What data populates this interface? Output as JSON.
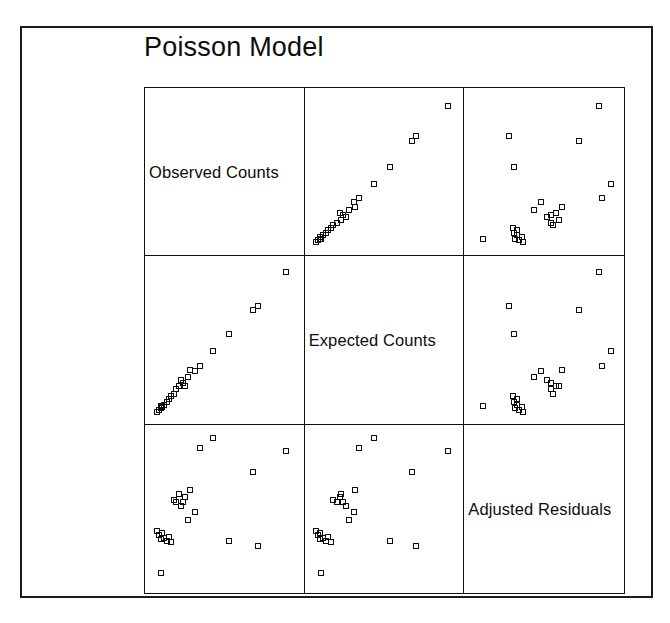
{
  "figure": {
    "title": "Poisson Model",
    "type": "scatterplot-matrix",
    "background_color": "#ffffff",
    "frame_color": "#1a1a1a",
    "marker_color": "#0a0a0a",
    "marker_shape": "open-square"
  },
  "chart_data": {
    "type": "scatter",
    "title": "Poisson Model",
    "xlabel": "",
    "ylabel": "",
    "grid": false,
    "legend": null,
    "layout": "3x3 scatterplot matrix (SPLOM) with variable names on the diagonal",
    "variables": [
      "Observed Counts",
      "Expected Counts",
      "Adjusted Residuals"
    ],
    "diagonal_labels": [
      "Observed Counts",
      "Expected Counts",
      "Adjusted Residuals"
    ],
    "n_points": 24,
    "axis_ranges": {
      "Observed Counts": [
        0,
        1
      ],
      "Expected Counts": [
        0,
        1
      ],
      "Adjusted Residuals": [
        0,
        1
      ]
    },
    "points": [
      {
        "observed": 0.035,
        "expected": 0.03,
        "residual": 0.355
      },
      {
        "observed": 0.05,
        "expected": 0.04,
        "residual": 0.33
      },
      {
        "observed": 0.06,
        "expected": 0.055,
        "residual": 0.3
      },
      {
        "observed": 0.07,
        "expected": 0.06,
        "residual": 0.345
      },
      {
        "observed": 0.085,
        "expected": 0.075,
        "residual": 0.31
      },
      {
        "observed": 0.1,
        "expected": 0.095,
        "residual": 0.29
      },
      {
        "observed": 0.115,
        "expected": 0.11,
        "residual": 0.315
      },
      {
        "observed": 0.13,
        "expected": 0.13,
        "residual": 0.285
      },
      {
        "observed": 0.15,
        "expected": 0.145,
        "residual": 0.56
      },
      {
        "observed": 0.165,
        "expected": 0.175,
        "residual": 0.545
      },
      {
        "observed": 0.185,
        "expected": 0.2,
        "residual": 0.6
      },
      {
        "observed": 0.2,
        "expected": 0.235,
        "residual": 0.52
      },
      {
        "observed": 0.215,
        "expected": 0.215,
        "residual": 0.545
      },
      {
        "observed": 0.23,
        "expected": 0.195,
        "residual": 0.58
      },
      {
        "observed": 0.25,
        "expected": 0.26,
        "residual": 0.43
      },
      {
        "observed": 0.265,
        "expected": 0.3,
        "residual": 0.62
      },
      {
        "observed": 0.3,
        "expected": 0.295,
        "residual": 0.48
      },
      {
        "observed": 0.33,
        "expected": 0.33,
        "residual": 0.9
      },
      {
        "observed": 0.53,
        "expected": 0.54,
        "residual": 0.29
      },
      {
        "observed": 0.7,
        "expected": 0.695,
        "residual": 0.74
      },
      {
        "observed": 0.735,
        "expected": 0.72,
        "residual": 0.255
      },
      {
        "observed": 0.93,
        "expected": 0.945,
        "residual": 0.88
      },
      {
        "observed": 0.06,
        "expected": 0.065,
        "residual": 0.08
      },
      {
        "observed": 0.42,
        "expected": 0.43,
        "residual": 0.96
      }
    ],
    "panels": [
      {
        "row": 0,
        "col": 0,
        "kind": "diagonal",
        "label": "Observed Counts"
      },
      {
        "row": 0,
        "col": 1,
        "kind": "scatter",
        "x": "Expected Counts",
        "y": "Observed Counts",
        "relationship": "strong positive linear"
      },
      {
        "row": 0,
        "col": 2,
        "kind": "scatter",
        "x": "Adjusted Residuals",
        "y": "Observed Counts",
        "relationship": "weak / scattered"
      },
      {
        "row": 1,
        "col": 0,
        "kind": "scatter",
        "x": "Observed Counts",
        "y": "Expected Counts",
        "relationship": "strong positive linear"
      },
      {
        "row": 1,
        "col": 1,
        "kind": "diagonal",
        "label": "Expected Counts"
      },
      {
        "row": 1,
        "col": 2,
        "kind": "scatter",
        "x": "Adjusted Residuals",
        "y": "Expected Counts",
        "relationship": "weak / scattered"
      },
      {
        "row": 2,
        "col": 0,
        "kind": "scatter",
        "x": "Observed Counts",
        "y": "Adjusted Residuals",
        "relationship": "weak / scattered"
      },
      {
        "row": 2,
        "col": 1,
        "kind": "scatter",
        "x": "Expected Counts",
        "y": "Adjusted Residuals",
        "relationship": "weak / scattered"
      },
      {
        "row": 2,
        "col": 2,
        "kind": "diagonal",
        "label": "Adjusted Residuals"
      }
    ]
  }
}
